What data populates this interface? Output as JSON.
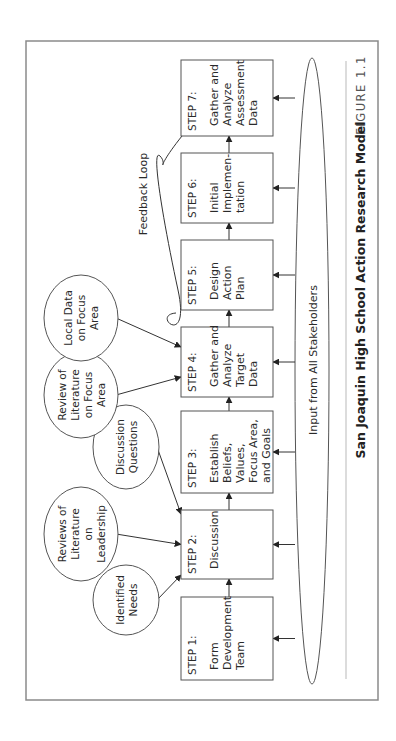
{
  "figure": {
    "label": "FIGURE 1.1",
    "title": "San Joaquin High School Action Research Model"
  },
  "steps": [
    {
      "step": "STEP 1:",
      "lines": [
        "Form",
        "Development",
        "Team"
      ]
    },
    {
      "step": "STEP 2:",
      "lines": [
        "Discussion"
      ]
    },
    {
      "step": "STEP 3:",
      "lines": [
        "Establish",
        "Beliefs,",
        "Values,",
        "Focus Area,",
        "and Goals"
      ]
    },
    {
      "step": "STEP 4:",
      "lines": [
        "Gather and",
        "Analyze",
        "Target",
        "Data"
      ]
    },
    {
      "step": "STEP 5:",
      "lines": [
        "Design",
        "Action",
        "Plan"
      ]
    },
    {
      "step": "STEP 6:",
      "lines": [
        "Initial",
        "Implemen-",
        "tation"
      ]
    },
    {
      "step": "STEP 7:",
      "lines": [
        "Gather and",
        "Analyze",
        "Assessment",
        "Data"
      ]
    }
  ],
  "inputs": [
    {
      "lines": [
        "Identified",
        "Needs"
      ],
      "target_step": 2
    },
    {
      "lines": [
        "Reviews of",
        "Literature",
        "on",
        "Leadership"
      ],
      "target_step": 2
    },
    {
      "lines": [
        "Discussion",
        "Questions"
      ],
      "target_step": 2
    },
    {
      "lines": [
        "Review of",
        "Literature",
        "on Focus",
        "Area"
      ],
      "target_step": 4
    },
    {
      "lines": [
        "Local Data",
        "on Focus",
        "Area"
      ],
      "target_step": 4
    }
  ],
  "feedback_label": "Feedback Loop",
  "stakeholders_label": "Input from All Stakeholders"
}
